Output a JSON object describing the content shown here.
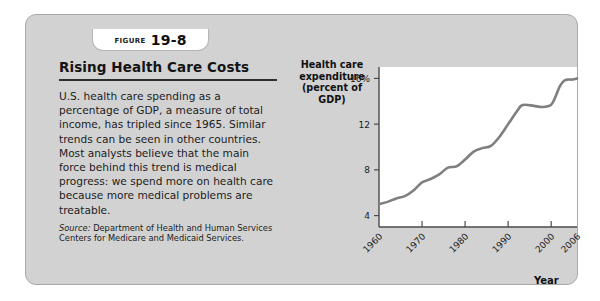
{
  "figure": {
    "tab_word": "Figure",
    "tab_number": "19-8",
    "title": "Rising Health Care Costs",
    "body": "U.S. health care spending as a percentage of GDP, a measure of total income, has tripled since 1965. Similar trends can be seen in other countries. Most analysts believe that the main force behind this trend is medical progress: we spend more on health care because more medical problems are treatable.",
    "source_label": "Source:",
    "source_text": "Department of Health and Human Services Centers for Medicare and Medicaid Services."
  },
  "colors": {
    "panel_bg": "#d2d2d2",
    "panel_border": "#a9a9a9",
    "plot_bg": "#ffffff",
    "line": "#7f7f7f",
    "axis": "#4a4a4a",
    "text": "#1b1b1b"
  },
  "chart_data": {
    "type": "line",
    "title": "",
    "ylabel": "Health care expenditure (percent of GDP)",
    "ylabel_lines": [
      "Health care",
      "expenditure",
      "(percent of GDP)"
    ],
    "xlabel": "Year",
    "ylim": [
      3.0,
      17.0
    ],
    "xlim": [
      1960,
      2006
    ],
    "yticks": [
      4,
      8,
      12,
      16
    ],
    "ytick_labels": [
      "4",
      "8",
      "12",
      "16%"
    ],
    "xticks": [
      1960,
      1970,
      1980,
      1990,
      2000,
      2006
    ],
    "xtick_labels": [
      "1960",
      "1970",
      "1980",
      "1990",
      "2000",
      "2006"
    ],
    "grid": false,
    "legend": "none",
    "series": [
      {
        "name": "Health care expenditure (percent of GDP)",
        "x": [
          1960,
          1962,
          1964,
          1966,
          1968,
          1970,
          1972,
          1974,
          1976,
          1978,
          1980,
          1982,
          1984,
          1986,
          1988,
          1990,
          1992,
          1993,
          1994,
          1996,
          1998,
          2000,
          2001,
          2002,
          2003,
          2004,
          2005,
          2006
        ],
        "values": [
          5.0,
          5.2,
          5.5,
          5.7,
          6.2,
          6.9,
          7.2,
          7.6,
          8.2,
          8.3,
          8.9,
          9.6,
          9.9,
          10.1,
          10.9,
          12.0,
          13.1,
          13.6,
          13.7,
          13.6,
          13.5,
          13.7,
          14.4,
          15.3,
          15.8,
          15.9,
          15.9,
          16.0
        ]
      }
    ]
  }
}
